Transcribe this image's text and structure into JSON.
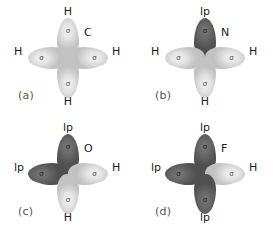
{
  "figure": {
    "sigma_symbol": "σ",
    "colors": {
      "background": "#ffffff",
      "bonding_lobe": "#e4e4e4",
      "lone_pair_lobe": "#6a6a6a",
      "label_text": "#1c1c1c",
      "panel_key_text": "#555555"
    }
  },
  "panels": [
    {
      "key": "(a)",
      "center_atom": "C",
      "lobes": [
        {
          "position": "up",
          "type": "bonding",
          "inner": "σ",
          "label": "H"
        },
        {
          "position": "left",
          "type": "bonding",
          "inner": "σ",
          "label": "H"
        },
        {
          "position": "right",
          "type": "bonding",
          "inner": "σ",
          "label": "H"
        },
        {
          "position": "down",
          "type": "bonding",
          "inner": "σ",
          "label": "H"
        }
      ]
    },
    {
      "key": "(b)",
      "center_atom": "N",
      "lobes": [
        {
          "position": "up",
          "type": "lone_pair",
          "inner": "σ",
          "label": "lp"
        },
        {
          "position": "left",
          "type": "bonding",
          "inner": "σ",
          "label": "H"
        },
        {
          "position": "right",
          "type": "bonding",
          "inner": "σ",
          "label": "H"
        },
        {
          "position": "down",
          "type": "bonding",
          "inner": "σ",
          "label": "H"
        }
      ]
    },
    {
      "key": "(c)",
      "center_atom": "O",
      "lobes": [
        {
          "position": "up",
          "type": "lone_pair",
          "inner": "σ",
          "label": "lp"
        },
        {
          "position": "left",
          "type": "lone_pair",
          "inner": "σ",
          "label": "lp"
        },
        {
          "position": "right",
          "type": "bonding",
          "inner": "σ",
          "label": "H"
        },
        {
          "position": "down",
          "type": "bonding",
          "inner": "σ",
          "label": "H"
        }
      ]
    },
    {
      "key": "(d)",
      "center_atom": "F",
      "lobes": [
        {
          "position": "up",
          "type": "lone_pair",
          "inner": "σ",
          "label": "lp"
        },
        {
          "position": "left",
          "type": "lone_pair",
          "inner": "σ",
          "label": "lp"
        },
        {
          "position": "right",
          "type": "bonding",
          "inner": "σ",
          "label": "H"
        },
        {
          "position": "down",
          "type": "lone_pair",
          "inner": "σ",
          "label": "lp"
        }
      ]
    }
  ]
}
